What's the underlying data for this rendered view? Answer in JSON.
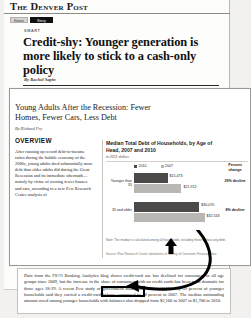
{
  "newspaper": {
    "masthead": "The Denver Post",
    "nav": [
      {
        "label": "Home",
        "active": false
      },
      {
        "label": "Story",
        "active": true
      }
    ],
    "kicker": "SMART",
    "headline": "Credit-shy: Younger generation is more likely to stick to a cash-only policy",
    "byline": "By Rachel Sapin",
    "left_column_snippet": "according to a new Pew Research Center analysis of"
  },
  "report": {
    "title": "Young Adults After the Recession: Fewer Homes, Fewer Cars, Less Debt",
    "byline": "By Richard Fry",
    "overview_heading": "OVERVIEW",
    "overview_body": "After running up record debt-to-income ratios during the bubble economy of the 2000s, young adults shed substantially more debt than older adults did during the Great Recession and its immediate aftermath—mainly by virtue of owning fewer houses and cars, according to a new Pew Research Center analysis of",
    "chart_note": "Note: The median is calculated among all households, including those without any debt.",
    "chart_source": "Source: Pew Research Center tabulations of Survey of Consumer Finances data"
  },
  "chart_data": {
    "type": "bar",
    "title": "Median Total Debt of Households, by Age of Head, 2007 and 2010",
    "subtitle": "in 2011 dollars",
    "xlabel": "",
    "ylabel": "",
    "orientation": "horizontal",
    "grid": false,
    "legend_position": "top",
    "categories": [
      "Younger than 35",
      "35 and older"
    ],
    "series": [
      {
        "name": "2010",
        "color": "#4c4a49",
        "values": [
          15473,
          30070
        ],
        "labels": [
          "$15,473",
          "$30,070"
        ]
      },
      {
        "name": "2007",
        "color": "#b9b7b4",
        "values": [
          21912,
          32543
        ],
        "labels": [
          "$21,912",
          "$32,543"
        ]
      }
    ],
    "annotation_column": {
      "header": "Percent change",
      "values": [
        "29% decline",
        "8% decline"
      ]
    },
    "xlim": [
      0,
      36000
    ]
  },
  "bottom_paragraph": {
    "text": "Data from the FICO Banking Analytics blog shows credit-card use has declined for consumers in all age groups since 2009, but the increase in the share of consumers with no credit cards has been most dramatic for those ages 18-29. A recent Pew study of government data found that in 2010, only 39 percent of younger households said they carried a credit-card balance compared to 48 percent in 2007. The median outstanding amount owed among younger households with balances also dropped from $2,100 in 2007 to $1,700 in 2010.",
    "highlighted_phrase": "A recent Pew study"
  },
  "annotations": {
    "arrow_color": "#000000",
    "cursor_color": "#000000"
  }
}
